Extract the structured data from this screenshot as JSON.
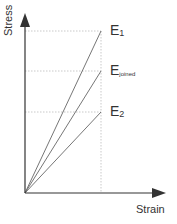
{
  "diagram": {
    "type": "stress-strain",
    "y_axis_label": "Stress",
    "x_axis_label": "Strain",
    "lines": [
      {
        "name": "E1",
        "base": "E",
        "sub": "1"
      },
      {
        "name": "Ejoined",
        "base": "E",
        "sub": "joined"
      },
      {
        "name": "E2",
        "base": "E",
        "sub": "2"
      }
    ],
    "colors": {
      "axis": "#333333",
      "line": "#666666",
      "guide": "#bbbbbb"
    }
  }
}
